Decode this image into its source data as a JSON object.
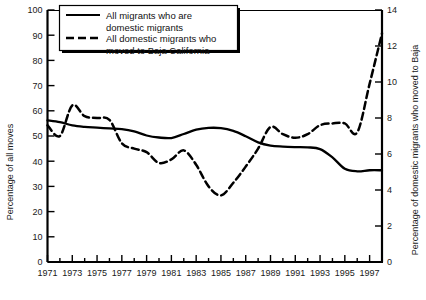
{
  "chart_data": {
    "type": "line",
    "title": "",
    "xlabel": "",
    "ylabel": "Percentage of all moves",
    "y2label": "Percentage of domestic migrants who moved to Baja",
    "xlim": [
      1971,
      1998
    ],
    "ylim": [
      0,
      100
    ],
    "y2lim": [
      0,
      14
    ],
    "grid": false,
    "legend_position": "top-center",
    "x_ticks_major": [
      1971,
      1973,
      1975,
      1977,
      1979,
      1981,
      1983,
      1985,
      1987,
      1989,
      1991,
      1993,
      1995,
      1997
    ],
    "x_ticks_minor": [
      1972,
      1974,
      1976,
      1978,
      1980,
      1982,
      1984,
      1986,
      1988,
      1990,
      1992,
      1994,
      1996,
      1998
    ],
    "y_ticks": [
      0,
      10,
      20,
      30,
      40,
      50,
      60,
      70,
      80,
      90,
      100
    ],
    "y2_ticks": [
      0,
      2,
      4,
      6,
      8,
      10,
      12,
      14
    ],
    "x": [
      1971,
      1972,
      1973,
      1974,
      1975,
      1976,
      1977,
      1978,
      1979,
      1980,
      1981,
      1982,
      1983,
      1984,
      1985,
      1986,
      1987,
      1988,
      1989,
      1990,
      1991,
      1992,
      1993,
      1994,
      1995,
      1996,
      1997,
      1998
    ],
    "series": [
      {
        "name": "All migrants who are domestic migrants",
        "axis": "left",
        "style": "solid",
        "color": "#000000",
        "values": [
          56.2,
          55.5,
          54.2,
          53.6,
          53.3,
          53.0,
          52.7,
          51.8,
          50.2,
          49.4,
          49.2,
          50.8,
          52.5,
          53.2,
          53.1,
          52.0,
          49.9,
          47.5,
          46.2,
          45.8,
          45.6,
          45.5,
          44.8,
          41.5,
          37.0,
          36.0,
          36.4,
          36.4
        ]
      },
      {
        "name": "All domestic migrants who moved to Baja California",
        "axis": "right",
        "style": "dashed",
        "color": "#000000",
        "values": [
          7.6,
          7.0,
          8.7,
          8.1,
          8.0,
          7.9,
          6.6,
          6.3,
          6.1,
          5.5,
          5.7,
          6.2,
          5.4,
          4.2,
          3.7,
          4.4,
          5.3,
          6.3,
          7.5,
          7.1,
          6.9,
          7.1,
          7.6,
          7.7,
          7.7,
          7.2,
          8.6,
          10.1
        ]
      }
    ],
    "series2_tail": {
      "note": "steep rise at the end",
      "x": [
        1996,
        1997,
        1998
      ],
      "values": [
        7.2,
        9.9,
        12.7
      ]
    }
  },
  "legend": {
    "items": [
      {
        "line1": "All migrants who are",
        "line2": "domestic migrants",
        "style": "solid"
      },
      {
        "line1": "All domestic migrants who",
        "line2": "moved to Baja California",
        "style": "dashed"
      }
    ]
  },
  "axes": {
    "left_title": "Percentage of all moves",
    "right_title": "Percentage of domestic migrants who moved to Baja",
    "left_ticks": [
      "0",
      "10",
      "20",
      "30",
      "40",
      "50",
      "60",
      "70",
      "80",
      "90",
      "100"
    ],
    "right_ticks": [
      "0",
      "2",
      "4",
      "6",
      "8",
      "10",
      "12",
      "14"
    ],
    "x_tick_labels": [
      "1971",
      "1973",
      "1975",
      "1977",
      "1979",
      "1981",
      "1983",
      "1985",
      "1987",
      "1989",
      "1991",
      "1993",
      "1995",
      "1997"
    ]
  }
}
